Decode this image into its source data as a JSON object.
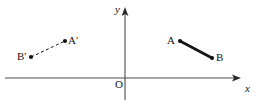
{
  "figure": {
    "width": 263,
    "height": 103,
    "background": "#ffffff",
    "ink_color": "#141414",
    "axis_color": "#4a4a4a"
  },
  "axes": {
    "x_axis": {
      "label": "x",
      "label_x": 245,
      "label_y": 83,
      "y": 78,
      "x_start": 5,
      "x_end": 241,
      "arrow": "right"
    },
    "y_axis": {
      "label": "y",
      "label_x": 115,
      "label_y": 4,
      "x": 125,
      "y_start": 8,
      "y_end": 100,
      "arrow": "up"
    },
    "origin": {
      "label": "O",
      "label_x": 115,
      "label_y": 79
    }
  },
  "segments": [
    {
      "name": "segment-a-prime-b-prime",
      "style": "dashed",
      "stroke_width": 1,
      "dash_pattern": "3 2.5",
      "points": [
        {
          "label": "B'",
          "x": 31,
          "y": 57,
          "label_x": 17,
          "label_y": 51,
          "label_anchor": "left"
        },
        {
          "label": "A'",
          "x": 65,
          "y": 41,
          "label_x": 68,
          "label_y": 35,
          "label_anchor": "right"
        }
      ]
    },
    {
      "name": "segment-a-b",
      "style": "solid",
      "stroke_width": 2.6,
      "dash_pattern": "",
      "points": [
        {
          "label": "A",
          "x": 180,
          "y": 41,
          "label_x": 167,
          "label_y": 35,
          "label_anchor": "left"
        },
        {
          "label": "B",
          "x": 212,
          "y": 58,
          "label_x": 216,
          "label_y": 52,
          "label_anchor": "right"
        }
      ]
    }
  ],
  "dot_radius": 2.1
}
